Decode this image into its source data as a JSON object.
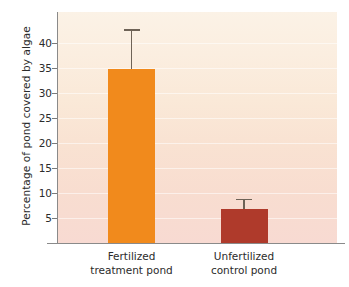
{
  "chart_data": {
    "type": "bar",
    "title": "",
    "xlabel": "",
    "ylabel": "Percentage of pond covered by algae",
    "categories": [
      "Fertilized treatment pond",
      "Unfertilized control pond"
    ],
    "category_lines": [
      [
        "Fertilized",
        "treatment pond"
      ],
      [
        "Unfertilized",
        "control pond"
      ]
    ],
    "values": [
      34.8,
      6.8
    ],
    "errors_upper": [
      42.8,
      8.9
    ],
    "error_sizes": [
      8.0,
      2.1
    ],
    "bar_colors": [
      "#F18A1C",
      "#AF3A2B"
    ],
    "ylim": [
      0,
      44
    ],
    "yticks": [
      5,
      10,
      15,
      20,
      25,
      30,
      35,
      40
    ],
    "ytick_labels": [
      "5",
      "10",
      "15",
      "20",
      "25",
      "30",
      "35",
      "40"
    ],
    "grid": true,
    "legend": null,
    "errorbar_color": "#6E6357",
    "axis_color": "#8A8A8A",
    "background_top_color": "#FBF2E6",
    "background_bottom_color": "#F8DAD2",
    "annotations": []
  }
}
